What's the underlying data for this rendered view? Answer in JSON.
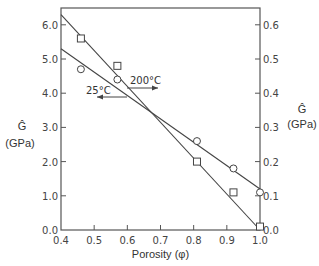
{
  "chart_data": {
    "type": "scatter",
    "title": "",
    "xlabel": "Porosity (φ)",
    "ylabel_left": "Ĝ",
    "ylabel_left_units": "(GPa)",
    "ylabel_right": "Ĝ",
    "ylabel_right_units": "(GPa)",
    "xlim": [
      0.4,
      1.0
    ],
    "ylim_left": [
      0.0,
      6.5
    ],
    "ylim_right": [
      0.0,
      0.65
    ],
    "x_ticks": [
      "0.4",
      "0.5",
      "0.6",
      "0.7",
      "0.8",
      "0.9",
      "1.0"
    ],
    "y_ticks_left": [
      "0.0",
      "1.0",
      "2.0",
      "3.0",
      "4.0",
      "5.0",
      "6.0"
    ],
    "y_ticks_right": [
      "0.0",
      "0.1",
      "0.2",
      "0.3",
      "0.4",
      "0.5",
      "0.6"
    ],
    "grid": false,
    "legend": "none (inline annotations with arrows)",
    "series": [
      {
        "name": "200°C",
        "marker": "square",
        "axis": "left",
        "x": [
          0.46,
          0.57,
          0.81,
          0.92,
          1.0
        ],
        "values": [
          5.6,
          4.8,
          2.0,
          1.1,
          0.1
        ],
        "fit_line": {
          "x": [
            0.4,
            1.0
          ],
          "y": [
            6.3,
            0.0
          ]
        }
      },
      {
        "name": "25°C",
        "marker": "circle",
        "axis": "right",
        "x": [
          0.46,
          0.57,
          0.81,
          0.92,
          1.0
        ],
        "values": [
          0.47,
          0.44,
          0.26,
          0.18,
          0.11
        ],
        "fit_line": {
          "x": [
            0.4,
            1.0
          ],
          "y": [
            0.53,
            0.12
          ]
        }
      }
    ],
    "annotations": [
      {
        "text": "200°C",
        "arrow": "right",
        "points_to_axis": "right"
      },
      {
        "text": "25°C",
        "arrow": "left",
        "points_to_axis": "left"
      }
    ]
  }
}
